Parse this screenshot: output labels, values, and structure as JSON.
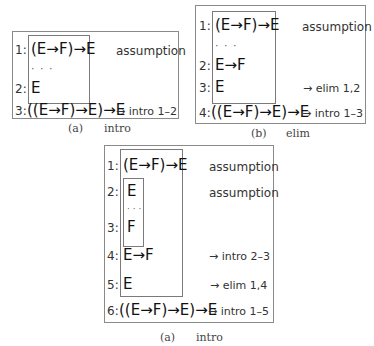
{
  "panels": [
    {
      "id": "a",
      "caption": {
        "label": "(a)",
        "title": "intro"
      },
      "lines": [
        {
          "num": "1:",
          "formula": "(E→F)→E",
          "justification": "assumption"
        },
        {
          "dots": "· · ·"
        },
        {
          "num": "2:",
          "formula": "E",
          "justification": ""
        },
        {
          "num": "3:",
          "formula": "((E→F)→E)→E",
          "justification": "→ intro 1–2"
        }
      ]
    },
    {
      "id": "b",
      "caption": {
        "label": "(b)",
        "title": "elim"
      },
      "lines": [
        {
          "num": "1:",
          "formula": "(E→F)→E",
          "justification": "assumption"
        },
        {
          "dots": "· · ·"
        },
        {
          "num": "2:",
          "formula": "E→F",
          "justification": ""
        },
        {
          "num": "3:",
          "formula": "E",
          "justification": "→ elim 1,2"
        },
        {
          "num": "4:",
          "formula": "((E→F)→E)→E",
          "justification": "→ intro 1–3"
        }
      ]
    },
    {
      "id": "c",
      "caption": {
        "label": "(a)",
        "title": "intro"
      },
      "lines": [
        {
          "num": "1:",
          "formula": "(E→F)→E",
          "justification": "assumption"
        },
        {
          "num": "2:",
          "formula": "E",
          "justification": "assumption"
        },
        {
          "dots": "· · ·"
        },
        {
          "num": "3:",
          "formula": "F",
          "justification": ""
        },
        {
          "num": "4:",
          "formula": "E→F",
          "justification": "→ intro 2–3"
        },
        {
          "num": "5:",
          "formula": "E",
          "justification": "→ elim 1,4"
        },
        {
          "num": "6:",
          "formula": "((E→F)→E)→E",
          "justification": "→ intro 1–5"
        }
      ]
    }
  ]
}
